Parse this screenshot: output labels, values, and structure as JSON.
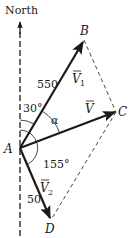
{
  "diagram": {
    "type": "vector-addition",
    "north_label": "North",
    "points": {
      "A": {
        "label": "A",
        "x": 20,
        "y": 148
      },
      "B": {
        "label": "B",
        "x": 84,
        "y": 40
      },
      "C": {
        "label": "C",
        "x": 116,
        "y": 112
      },
      "D": {
        "label": "D",
        "x": 51,
        "y": 220
      }
    },
    "vectors": [
      {
        "id": "V1",
        "name": "V",
        "subscript": "1",
        "from": "A",
        "to": "B",
        "magnitude_label": "550"
      },
      {
        "id": "V",
        "name": "V",
        "subscript": "",
        "from": "A",
        "to": "C",
        "magnitude_label": ""
      },
      {
        "id": "V2",
        "name": "V",
        "subscript": "2",
        "from": "A",
        "to": "D",
        "magnitude_label": "50"
      }
    ],
    "dashed_lines": [
      {
        "from": "B",
        "to": "C"
      },
      {
        "from": "C",
        "to": "D"
      }
    ],
    "angles": [
      {
        "label": "30°",
        "between": "North and V1"
      },
      {
        "label": "α",
        "between": "V1 and V"
      },
      {
        "label": "155°",
        "between": "North and V2"
      }
    ],
    "colors": {
      "stroke": "#1a1a1a",
      "background": "#ffffff"
    }
  }
}
